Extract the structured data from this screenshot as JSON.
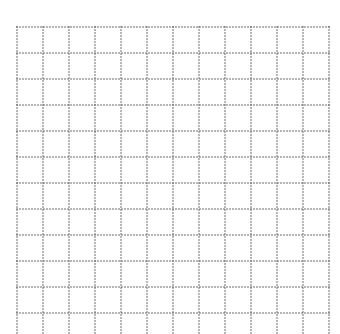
{
  "grid": {
    "background": "#ffffff",
    "dot_color": "#5a5a5a",
    "origin_x": 17,
    "origin_y": 27,
    "cell_size": 26,
    "columns": 12,
    "rows_visible": 12,
    "bottom_extends_past_edge": true,
    "bottom_y": 334,
    "dot_spacing": 3,
    "dot_radius": 0.8
  }
}
